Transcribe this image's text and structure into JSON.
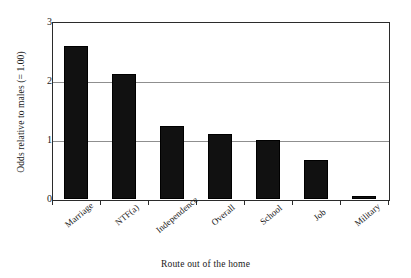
{
  "chart_data": {
    "type": "bar",
    "title": "",
    "xlabel": "Route out of the home",
    "ylabel": "Odds relative to males (= 1.00)",
    "categories": [
      "Marriage",
      "NTF(a)",
      "Independence",
      "Overall",
      "School",
      "Job",
      "Military"
    ],
    "values": [
      2.6,
      2.12,
      1.24,
      1.1,
      1.0,
      0.66,
      0.05
    ],
    "ylim": [
      0,
      3
    ],
    "yticks": [
      0,
      1,
      2,
      3
    ],
    "ytick_labels": [
      "0",
      "1",
      "2",
      "3"
    ],
    "grid": true,
    "grid_axis": "y",
    "legend": false,
    "legend_position": "none",
    "bar_color": "#111111",
    "grid_color": "#8f8f8f",
    "axis_color": "#2b2b2b",
    "background_color": "#ffffff"
  }
}
